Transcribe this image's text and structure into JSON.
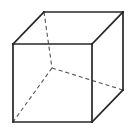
{
  "figure": {
    "kind": "wireframe-cube",
    "canvas": {
      "width": 135,
      "height": 135,
      "background_color": "#ffffff"
    },
    "style": {
      "visible_edge_color": "#262626",
      "visible_edge_width": 1.7,
      "hidden_edge_color": "#555555",
      "hidden_edge_width": 1.1,
      "hidden_edge_dash": "4 3"
    },
    "vertices": {
      "front_top_left": {
        "name": "front-top-left",
        "x": 13,
        "y": 44
      },
      "front_top_right": {
        "name": "front-top-right",
        "x": 92,
        "y": 44
      },
      "front_bottom_right": {
        "name": "front-bottom-right",
        "x": 92,
        "y": 122
      },
      "front_bottom_left": {
        "name": "front-bottom-left",
        "x": 13,
        "y": 122
      },
      "back_top_left": {
        "name": "back-top-left",
        "x": 44,
        "y": 12
      },
      "back_top_right": {
        "name": "back-top-right",
        "x": 123,
        "y": 12
      },
      "back_bottom_right": {
        "name": "back-bottom-right",
        "x": 123,
        "y": 90
      },
      "back_bottom_left": {
        "name": "back-bottom-left-hidden",
        "x": 52,
        "y": 68
      }
    },
    "edges_visible": [
      {
        "name": "front-face-top-edge",
        "points": "13,44 92,44"
      },
      {
        "name": "front-face-right-edge",
        "points": "92,44 92,122"
      },
      {
        "name": "front-face-bottom-edge",
        "points": "92,122 13,122"
      },
      {
        "name": "front-face-left-edge",
        "points": "13,122 13,44"
      },
      {
        "name": "back-face-top-edge",
        "points": "44,12 123,12"
      },
      {
        "name": "back-face-right-edge",
        "points": "123,12 123,90"
      },
      {
        "name": "connector-top-left",
        "points": "13,44 44,12"
      },
      {
        "name": "connector-top-right",
        "points": "92,44 123,12"
      },
      {
        "name": "connector-bottom-right",
        "points": "92,122 123,90"
      }
    ],
    "edges_hidden": [
      {
        "name": "back-face-left-edge",
        "points": "44,12 52,68"
      },
      {
        "name": "back-face-bottom-edge",
        "points": "52,68 123,90"
      },
      {
        "name": "connector-bottom-left",
        "points": "52,68 13,122"
      }
    ]
  }
}
